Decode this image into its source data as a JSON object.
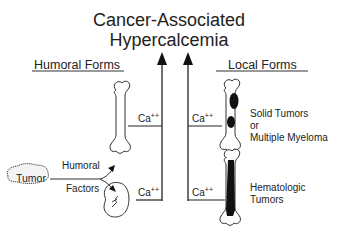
{
  "title": {
    "line1": "Cancer-Associated",
    "line2": "Hypercalcemia"
  },
  "sections": {
    "humoral": "Humoral Forms",
    "local": "Local Forms"
  },
  "nodes": {
    "tumor": "Tumor",
    "humoral_factors_line1": "Humoral",
    "humoral_factors_line2": "Factors",
    "solid_line1": "Solid Tumors",
    "solid_line2": "or",
    "solid_line3": "Multiple Myeloma",
    "hema_line1": "Hematologic",
    "hema_line2": "Tumors"
  },
  "ca": {
    "symbol": "Ca",
    "charge": "++"
  },
  "icons": [
    "bone-icon",
    "kidney-icon",
    "bone-with-lesions-icon",
    "bone-with-marrow-icon",
    "tumor-blob-icon",
    "arrow-up-icon"
  ]
}
